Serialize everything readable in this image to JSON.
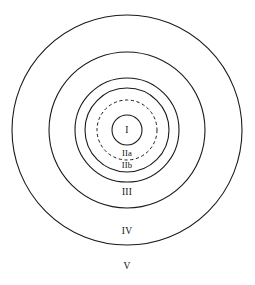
{
  "diagram": {
    "type": "concentric-zone-diagram",
    "background_color": "#ffffff",
    "stroke_color": "#1a1a1a",
    "center": {
      "x": 127,
      "y": 130
    },
    "rings": [
      {
        "id": "ring-v",
        "label": "V",
        "radius": 115,
        "style": "solid",
        "label_position": {
          "x": 127,
          "y": 267
        }
      },
      {
        "id": "ring-iv",
        "label": "IV",
        "radius": 78,
        "style": "solid",
        "label_position": {
          "x": 127,
          "y": 232
        }
      },
      {
        "id": "ring-iii",
        "label": "III",
        "radius": 52,
        "style": "solid",
        "label_position": {
          "x": 127,
          "y": 193
        }
      },
      {
        "id": "ring-iib",
        "label": "IIb",
        "radius": 42,
        "style": "solid",
        "label_position": {
          "x": 127,
          "y": 166
        }
      },
      {
        "id": "ring-iia",
        "label": "IIa",
        "radius": 30,
        "style": "dashed",
        "label_position": {
          "x": 127,
          "y": 154
        }
      },
      {
        "id": "ring-i",
        "label": "I",
        "radius": 15,
        "style": "solid",
        "label_position": {
          "x": 127,
          "y": 131
        }
      }
    ],
    "labels": {
      "zone_1": "I",
      "zone_2a": "IIa",
      "zone_2b": "IIb",
      "zone_3": "III",
      "zone_4": "IV",
      "zone_5": "V"
    }
  }
}
